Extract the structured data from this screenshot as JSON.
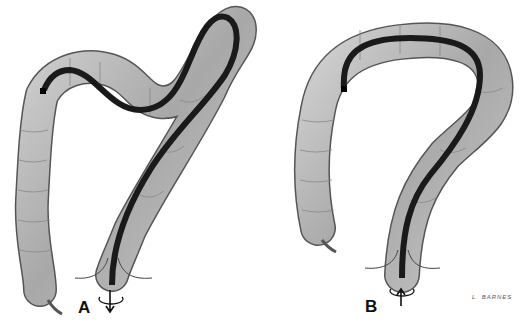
{
  "figure": {
    "panels": [
      {
        "label": "A",
        "scope_motion": "withdraw",
        "arrow_direction": "down",
        "rotation": "torque"
      },
      {
        "label": "B",
        "scope_motion": "advance",
        "arrow_direction": "up",
        "rotation": "torque"
      }
    ],
    "signature": "L. BARNES"
  },
  "colors": {
    "colon_fill": "#b8b8b8",
    "colon_outline": "#555555",
    "scope": "#1a1a1a",
    "background": "#ffffff"
  }
}
